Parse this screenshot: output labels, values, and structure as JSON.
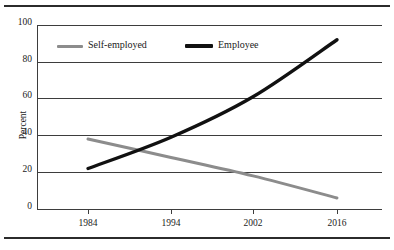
{
  "chart_data": {
    "type": "line",
    "title": "",
    "xlabel": "",
    "ylabel": "Percent",
    "x": [
      1984,
      1994,
      2002,
      2016
    ],
    "xtick_labels": [
      "1984",
      "1994",
      "2002",
      "2016"
    ],
    "ytick_labels": [
      "0",
      "20",
      "40",
      "60",
      "80",
      "100"
    ],
    "yticks": [
      0,
      20,
      40,
      60,
      80,
      100
    ],
    "ylim": [
      0,
      100
    ],
    "grid": true,
    "legend_position": "top-left-inside",
    "series": [
      {
        "name": "Self-employed",
        "color": "#8c8c8c",
        "values": [
          38,
          28,
          18,
          6
        ]
      },
      {
        "name": "Employee",
        "color": "#111111",
        "values": [
          22,
          39,
          61,
          92
        ]
      }
    ]
  },
  "axes": {
    "y_label": "Percent",
    "y_ticks": [
      {
        "label": "100",
        "value": 100
      },
      {
        "label": "80",
        "value": 80
      },
      {
        "label": "60",
        "value": 60
      },
      {
        "label": "40",
        "value": 40
      },
      {
        "label": "20",
        "value": 20
      },
      {
        "label": "0",
        "value": 0
      }
    ],
    "x_ticks": [
      {
        "label": "1984"
      },
      {
        "label": "1994"
      },
      {
        "label": "2002"
      },
      {
        "label": "2016"
      }
    ]
  },
  "legend": {
    "entries": [
      {
        "label": "Self-employed",
        "color": "#8c8c8c"
      },
      {
        "label": "Employee",
        "color": "#111111"
      }
    ]
  }
}
